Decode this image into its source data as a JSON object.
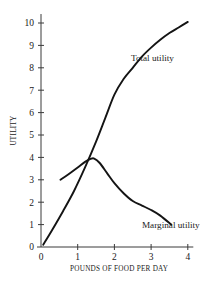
{
  "chart_data": {
    "type": "line",
    "title": "",
    "xlabel": "POUNDS OF FOOD PER DAY",
    "ylabel": "UTILITY",
    "xlim": [
      0,
      4.15
    ],
    "ylim": [
      0,
      10.4
    ],
    "xticks": [
      0,
      1,
      2,
      3,
      4
    ],
    "xtick_labels": [
      "0",
      "1",
      "2",
      "3",
      "4"
    ],
    "yticks": [
      0,
      1,
      2,
      3,
      4,
      5,
      6,
      7,
      8,
      9,
      10
    ],
    "ytick_labels": [
      "0",
      "1",
      "2",
      "3",
      "4",
      "5",
      "6",
      "7",
      "8",
      "9",
      "10"
    ],
    "grid": false,
    "legend_position": "inline-annotation",
    "series": [
      {
        "name": "Total utility",
        "label_x": 2.45,
        "label_y": 8.3,
        "x": [
          0.06,
          0.3,
          0.6,
          0.9,
          1.2,
          1.5,
          1.75,
          2.0,
          2.25,
          2.5,
          2.75,
          3.0,
          3.25,
          3.5,
          3.75,
          4.0
        ],
        "y": [
          0.1,
          0.75,
          1.6,
          2.5,
          3.55,
          4.7,
          5.75,
          6.8,
          7.5,
          8.0,
          8.5,
          8.9,
          9.25,
          9.55,
          9.8,
          10.05
        ]
      },
      {
        "name": "Marginal utility",
        "label_x": 2.75,
        "label_y": 0.85,
        "x": [
          0.53,
          0.75,
          1.0,
          1.2,
          1.35,
          1.45,
          1.6,
          1.8,
          2.0,
          2.25,
          2.5,
          2.75,
          3.0,
          3.25,
          3.55
        ],
        "y": [
          3.0,
          3.25,
          3.55,
          3.8,
          3.93,
          3.95,
          3.75,
          3.3,
          2.85,
          2.4,
          2.05,
          1.85,
          1.65,
          1.4,
          1.0
        ]
      }
    ],
    "annotations": [
      {
        "text": "Total utility",
        "x": 2.45,
        "y": 8.3
      },
      {
        "text": "Marginal utility",
        "x": 2.75,
        "y": 0.85
      }
    ]
  }
}
